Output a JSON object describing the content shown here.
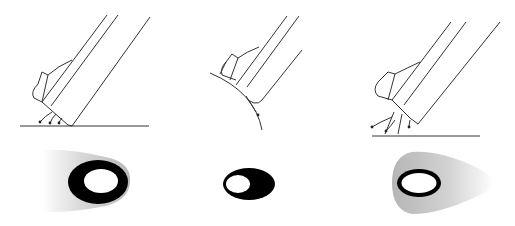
{
  "diagram": {
    "type": "technical-illustration",
    "panels": [
      {
        "id": "left",
        "description": "Angled tool on flat surface with spray flowing backward",
        "surface": "flat",
        "footprint": "black-ring-with-gray-trailing-halo-left"
      },
      {
        "id": "center",
        "description": "Tool tangent to convex curved surface",
        "surface": "convex-curve",
        "footprint": "black-oval-with-offset-white-hole"
      },
      {
        "id": "right",
        "description": "Angled tool raised above flat surface with spread spray",
        "surface": "flat",
        "footprint": "thin-black-ring-with-gray-teardrop-halo-right"
      }
    ],
    "colors": {
      "line": "#333333",
      "fill_black": "#000000",
      "halo_gray": "#c8c8c8",
      "background": "#ffffff"
    }
  }
}
